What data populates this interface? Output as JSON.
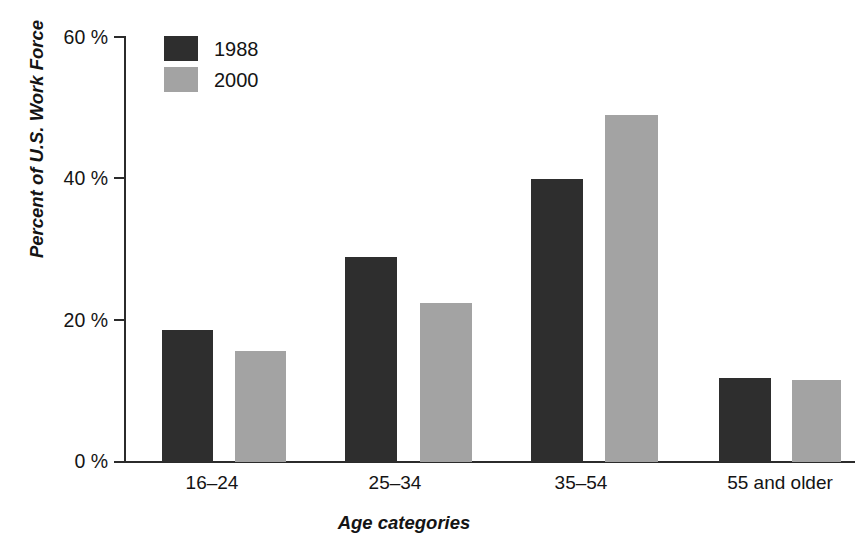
{
  "chart_data": {
    "type": "bar",
    "title": "",
    "subtitle": "",
    "xlabel": "Age categories",
    "ylabel": "Percent of U.S. Work Force",
    "categories": [
      "16–24",
      "25–34",
      "35–54",
      "55 and older"
    ],
    "series": [
      {
        "name": "1988",
        "color": "#2e2e2e",
        "values": [
          18.6,
          29.0,
          40.0,
          11.9
        ]
      },
      {
        "name": "2000",
        "color": "#a3a3a3",
        "values": [
          15.7,
          22.5,
          49.0,
          11.6
        ]
      }
    ],
    "ylim": [
      0,
      60
    ],
    "yticks": [
      0,
      20,
      40,
      60
    ],
    "ytick_labels": [
      "0 %",
      "20 %",
      "40 %",
      "60 %"
    ],
    "grid": false,
    "legend_position": "top-left",
    "legend_entries": [
      "1988",
      "2000"
    ]
  },
  "axis": {
    "y_title": "Percent of U.S. Work Force",
    "x_title": "Age categories"
  }
}
